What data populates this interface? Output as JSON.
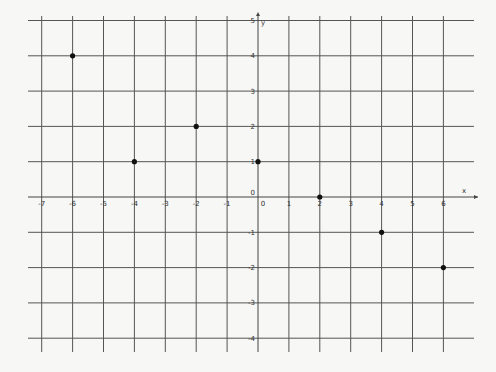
{
  "chart_data": {
    "type": "scatter",
    "title": "",
    "xlabel": "x",
    "ylabel": "y",
    "xlim": [
      -7,
      6.5
    ],
    "ylim": [
      -4.5,
      5
    ],
    "grid": true,
    "x_ticks": [
      -7,
      -6,
      -5,
      -4,
      -3,
      -2,
      -1,
      0,
      1,
      2,
      3,
      4,
      5,
      6
    ],
    "y_ticks": [
      -4,
      -3,
      -2,
      -1,
      0,
      1,
      2,
      3,
      4,
      5
    ],
    "origin_label": "0",
    "points": [
      {
        "x": -6,
        "y": 4
      },
      {
        "x": -4,
        "y": 1
      },
      {
        "x": -2,
        "y": 2
      },
      {
        "x": 0,
        "y": 1
      },
      {
        "x": 2,
        "y": 0
      },
      {
        "x": 4,
        "y": -1
      },
      {
        "x": 6,
        "y": -2
      }
    ],
    "colors": {
      "grid": "#555555",
      "point": "#111111",
      "background": "#f7f7f6"
    }
  }
}
